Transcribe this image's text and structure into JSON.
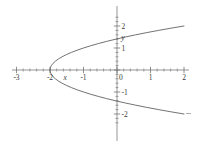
{
  "figure": {
    "background": "#ffffff",
    "axis_color": "#6b6b6b",
    "curve_color": "#585858",
    "label_color": "#3a3a3a"
  },
  "chart_data": {
    "type": "line",
    "title": "",
    "subtitle": "",
    "xlabel": "x",
    "ylabel": "y",
    "xlim": [
      -3.1,
      2.15
    ],
    "ylim": [
      -2.45,
      2.45
    ],
    "grid": false,
    "legend": null,
    "x_ticks": [
      -3,
      -2,
      -1,
      0,
      1,
      2
    ],
    "x_tick_labels": [
      "-3",
      "-2",
      "-1",
      "0",
      "1",
      "2"
    ],
    "y_ticks": [
      -2,
      -1,
      1,
      2
    ],
    "y_tick_labels": [
      "-2",
      "-1",
      "1",
      "2"
    ],
    "origin_label": "0",
    "minor_tick_step": 0.2,
    "equation": "x = y^2 - 2",
    "vertex": [
      -2,
      0
    ],
    "annotations": [
      {
        "text": "x",
        "x": -1.55,
        "y": -0.45,
        "italic": true
      },
      {
        "text": "y",
        "x": 0.18,
        "y": 1.35,
        "italic": true
      }
    ],
    "series": [
      {
        "name": "upper-branch",
        "points": [
          [
            -2.0,
            0.0
          ],
          [
            -1.99,
            0.1
          ],
          [
            -1.96,
            0.2
          ],
          [
            -1.91,
            0.3
          ],
          [
            -1.84,
            0.4
          ],
          [
            -1.75,
            0.5
          ],
          [
            -1.64,
            0.6
          ],
          [
            -1.51,
            0.7
          ],
          [
            -1.36,
            0.8
          ],
          [
            -1.19,
            0.9
          ],
          [
            -1.0,
            1.0
          ],
          [
            -0.79,
            1.1
          ],
          [
            -0.56,
            1.2
          ],
          [
            -0.31,
            1.3
          ],
          [
            -0.04,
            1.4
          ],
          [
            0.25,
            1.5
          ],
          [
            0.56,
            1.6
          ],
          [
            0.89,
            1.7
          ],
          [
            1.24,
            1.8
          ],
          [
            1.61,
            1.9
          ],
          [
            2.0,
            2.0
          ]
        ]
      },
      {
        "name": "lower-branch",
        "points": [
          [
            -2.0,
            0.0
          ],
          [
            -1.99,
            -0.1
          ],
          [
            -1.96,
            -0.2
          ],
          [
            -1.91,
            -0.3
          ],
          [
            -1.84,
            -0.4
          ],
          [
            -1.75,
            -0.5
          ],
          [
            -1.64,
            -0.6
          ],
          [
            -1.51,
            -0.7
          ],
          [
            -1.36,
            -0.8
          ],
          [
            -1.19,
            -0.9
          ],
          [
            -1.0,
            -1.0
          ],
          [
            -0.79,
            -1.1
          ],
          [
            -0.56,
            -1.2
          ],
          [
            -0.31,
            -1.3
          ],
          [
            -0.04,
            -1.4
          ],
          [
            0.25,
            -1.5
          ],
          [
            0.56,
            -1.6
          ],
          [
            0.89,
            -1.7
          ],
          [
            1.24,
            -1.8
          ],
          [
            1.61,
            -1.9
          ],
          [
            2.0,
            -2.0
          ]
        ]
      }
    ]
  }
}
